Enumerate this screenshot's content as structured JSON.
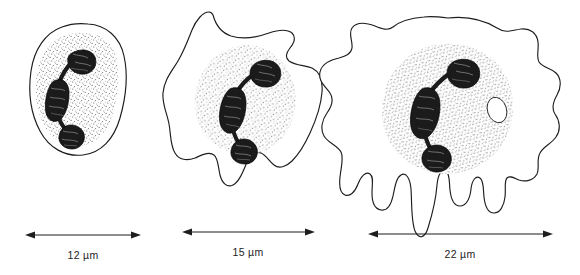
{
  "figure": {
    "type": "scientific-illustration",
    "background_color": "#ffffff",
    "ink_color": "#1d1d1d",
    "stipple_color": "#6e6e6e",
    "nucleus_color": "#1b1b1b"
  },
  "cells": [
    {
      "id": "cell-1",
      "stage_label": "rounded cell",
      "scale_value": "12",
      "scale_unit": "µm",
      "scale_label": "12 µm",
      "membrane_shape": "smooth-round",
      "nucleus_lobes": 3,
      "has_vacuole": false,
      "pseudopodia_count": 0
    },
    {
      "id": "cell-2",
      "stage_label": "spreading cell with pseudopodia",
      "scale_value": "15",
      "scale_unit": "µm",
      "scale_label": "15 µm",
      "membrane_shape": "stellate-pseudopodia",
      "nucleus_lobes": 3,
      "has_vacuole": false,
      "pseudopodia_count": 5
    },
    {
      "id": "cell-3",
      "stage_label": "fully spread cell with filopodia",
      "scale_value": "22",
      "scale_unit": "µm",
      "scale_label": "22 µm",
      "membrane_shape": "ruffled-with-filopodia",
      "nucleus_lobes": 3,
      "has_vacuole": true,
      "pseudopodia_count": 8
    }
  ],
  "scale_bars": [
    {
      "label": "12 µm"
    },
    {
      "label": "15 µm"
    },
    {
      "label": "22 µm"
    }
  ]
}
